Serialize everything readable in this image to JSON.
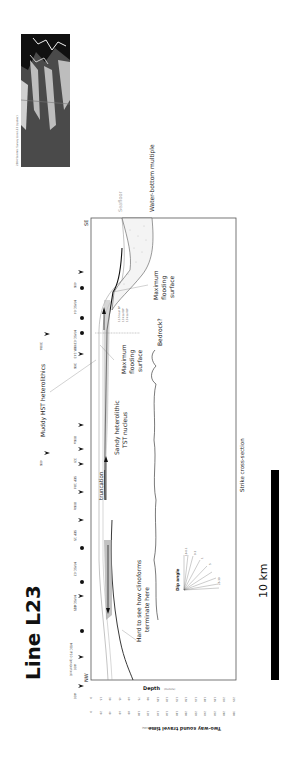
{
  "figure": {
    "title": "Line L23",
    "inset_caption": "2004 Seismic Survey Line L23 (spaker)",
    "caption_bottom": "Strike cross-section",
    "scale_bar_label": "10 km",
    "orientation": {
      "left_end": "NW",
      "right_end": "SE"
    },
    "labels": {
      "seafloor": "Seafloor",
      "water_bottom_multiple": "Water-bottom multiple",
      "muddy_hst": "Muddy HST heterolithics",
      "sandy_tst": "Sandy heterolithic TST nucleus",
      "truncation": "truncation",
      "mfs_center": "Maximum flooding surface",
      "mfs_right": "Maximum flooding surface",
      "bedrock": "Bedrock?",
      "clinoforms": "Hard to see how clinoforms terminate here",
      "dip_angle": "Dip angle"
    },
    "ages": [
      "11.5 kcal BP",
      "13 kcal BP",
      "13 kcal BP"
    ],
    "axis": {
      "depth_label": "Depth",
      "depth_unit": "(meters)",
      "twt_label": "Two-way sound travel time",
      "twt_unit": "(milliseconds)",
      "depth_ticks": [
        "0",
        "15",
        "30",
        "45",
        "60",
        "75",
        "90",
        "105",
        "120",
        "135",
        "150",
        "165",
        "180",
        "195",
        "210",
        "225"
      ],
      "twt_ticks": [
        "0",
        "20",
        "40",
        "60",
        "80",
        "100",
        "120",
        "140",
        "160",
        "180",
        "200",
        "220",
        "240",
        "260",
        "280",
        "300"
      ]
    },
    "wells": [
      {
        "name": "40K",
        "type": "crossing"
      },
      {
        "name": "MVSC-04",
        "type": "core"
      },
      {
        "name": "MVSC-03",
        "type": "core"
      },
      {
        "name": "VIBR-143",
        "type": "core"
      },
      {
        "name": "36K",
        "type": "crossing"
      },
      {
        "name": "80Ka",
        "type": "crossing"
      },
      {
        "name": "32I",
        "type": "crossing"
      },
      {
        "name": "SEP 18d",
        "type": "crossing"
      },
      {
        "name": "80Kb",
        "type": "crossing"
      },
      {
        "name": "SEP 15",
        "type": "crossing"
      },
      {
        "name": "MVSC-02",
        "type": "core"
      },
      {
        "name": "MVSC-01",
        "type": "core"
      },
      {
        "name": "A05",
        "type": "crossing"
      },
      {
        "name": "MOC P10 (projected)",
        "type": "core"
      },
      {
        "name": "A00",
        "type": "crossing"
      },
      {
        "name": "A00",
        "type": "crossing"
      }
    ],
    "extra_marker": "40K",
    "extra_marker2": "308A",
    "dip_angles": [
      "10-0.1",
      "0.3",
      "1",
      "3",
      "5",
      "8",
      "10",
      "15",
      "20",
      "25-30"
    ]
  }
}
